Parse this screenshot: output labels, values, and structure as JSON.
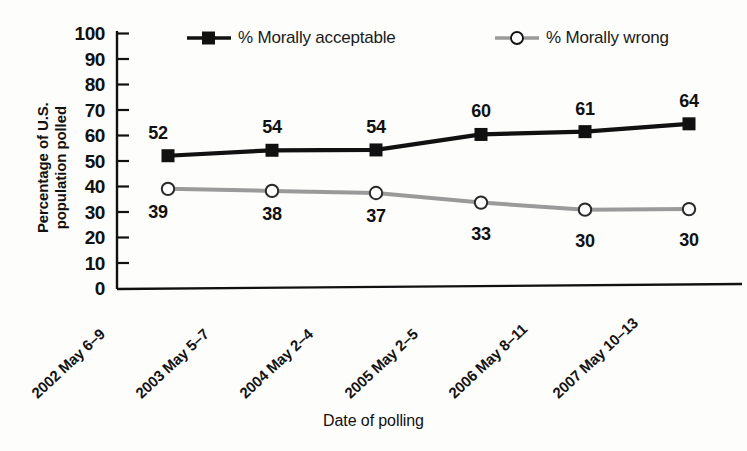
{
  "chart_data": {
    "type": "line",
    "title": "",
    "xlabel": "Date of polling",
    "ylabel": "Percentage of U.S. population polled",
    "ylabel_line1": "Percentage of U.S.",
    "ylabel_line2": "population polled",
    "ylim": [
      0,
      100
    ],
    "ytick_step": 10,
    "yticks": [
      "100",
      "90",
      "80",
      "70",
      "60",
      "50",
      "40",
      "30",
      "20",
      "10",
      "0"
    ],
    "grid": false,
    "legend_position": "top-inside",
    "categories": [
      "2002 May 6–9",
      "2003 May 5–7",
      "2004 May 2–4",
      "2005 May 2–5",
      "2006 May 8–11",
      "2007 May 10–13"
    ],
    "series": [
      {
        "name": "% Morally acceptable",
        "values": [
          52,
          54,
          54,
          60,
          61,
          64
        ],
        "color": "#111111",
        "marker": "filled-square",
        "label_position": "above"
      },
      {
        "name": "% Morally wrong",
        "values": [
          39,
          38,
          37,
          33,
          30,
          30
        ],
        "color": "#9a9a9a",
        "marker": "open-circle",
        "label_position": "below"
      }
    ]
  },
  "legend": {
    "items": [
      {
        "label": "% Morally acceptable",
        "marker": "filled-square-icon",
        "color": "#111111"
      },
      {
        "label": "% Morally wrong",
        "marker": "open-circle-icon",
        "color": "#9a9a9a"
      }
    ]
  },
  "axis": {
    "x_title": "Date of polling",
    "y_title_line1": "Percentage of U.S.",
    "y_title_line2": "population polled"
  },
  "value_labels": {
    "acceptable": [
      "52",
      "54",
      "54",
      "60",
      "61",
      "64"
    ],
    "wrong": [
      "39",
      "38",
      "37",
      "33",
      "30",
      "30"
    ]
  }
}
